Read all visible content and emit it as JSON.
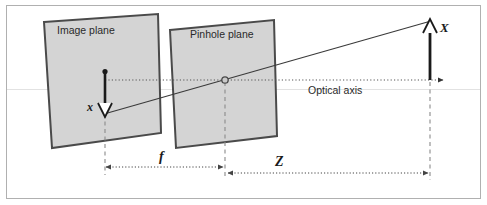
{
  "figure": {
    "background_color": "#ffffff",
    "border_color": "#b0b0b0",
    "plane_fill": "#d4d4d4",
    "plane_stroke": "#4a4a4a",
    "line_color": "#3a3a3a",
    "dotted_color": "#555555",
    "dashed_color": "#8a8a8a"
  },
  "labels": {
    "image_plane": "Image plane",
    "pinhole_plane": "Pinhole plane",
    "optical_axis": "Optical axis",
    "image_point_symbol": "x",
    "object_point_symbol": "X",
    "focal_length_symbol": "f",
    "depth_symbol": "Z"
  },
  "geometry": {
    "image_plane_corners": "44,22 158,14 161,133 52,148",
    "pinhole_plane_corners": "170,30 274,20 277,136 176,148",
    "pinhole_center": {
      "x": 225,
      "y": 80
    },
    "optical_axis_y": 80,
    "ray_start": {
      "x": 105,
      "y": 114
    },
    "ray_end": {
      "x": 430,
      "y": 22
    },
    "image_arrow_x": 105,
    "object_arrow_x": 430,
    "focal_dim_y": 167,
    "depth_dim_y": 173
  }
}
